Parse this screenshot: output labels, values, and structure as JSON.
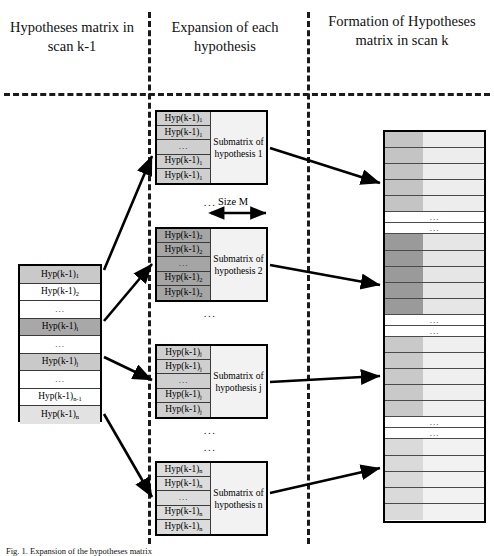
{
  "figure": {
    "caption": "Fig. 1. Expansion of the hypotheses matrix"
  },
  "columns": {
    "left_title": "Hypotheses matrix in scan k-1",
    "middle_title": "Expansion of each hypothesis",
    "right_title": "Formation of Hypotheses matrix in scan k"
  },
  "left_matrix": {
    "name": "hypotheses-matrix-scan-k-1",
    "rows": [
      {
        "label": "Hyp(k-1)",
        "sub": "1",
        "shade": "#c9c9c9"
      },
      {
        "label": "Hyp(k-1)",
        "sub": "2",
        "shade": "#ffffff"
      },
      {
        "label": "...",
        "sub": "",
        "shade": "#ffffff"
      },
      {
        "label": "Hyp(k-1)",
        "sub": "i",
        "shade": "#a8a8a8"
      },
      {
        "label": "...",
        "sub": "",
        "shade": "#ffffff"
      },
      {
        "label": "Hyp(k-1)",
        "sub": "j",
        "shade": "#c9c9c9"
      },
      {
        "label": "...",
        "sub": "",
        "shade": "#ffffff"
      },
      {
        "label": "Hyp(k-1)",
        "sub": "n-1",
        "shade": "#ffffff"
      },
      {
        "label": "Hyp(k-1)",
        "sub": "n",
        "shade": "#e2e2e2"
      }
    ]
  },
  "size_label": "Size M",
  "ellipsis": "...",
  "submatrices": [
    {
      "name": "submatrix-hypothesis-1",
      "title": "Submatrix of hypothesis 1",
      "cell_shade": "#cfcfcf",
      "rows": [
        {
          "label": "Hyp(k-1)",
          "sub": "1"
        },
        {
          "label": "Hyp(k-1)",
          "sub": "1"
        },
        {
          "label": "...",
          "sub": ""
        },
        {
          "label": "Hyp(k-1)",
          "sub": "1"
        },
        {
          "label": "Hyp(k-1)",
          "sub": "1"
        }
      ]
    },
    {
      "name": "submatrix-hypothesis-2",
      "title": "Submatrix of hypothesis 2",
      "cell_shade": "#a5a5a5",
      "rows": [
        {
          "label": "Hyp(k-1)",
          "sub": "2"
        },
        {
          "label": "Hyp(k-1)",
          "sub": "2"
        },
        {
          "label": "...",
          "sub": ""
        },
        {
          "label": "Hyp(k-1)",
          "sub": "2"
        },
        {
          "label": "Hyp(k-1)",
          "sub": "2"
        }
      ]
    },
    {
      "name": "submatrix-hypothesis-j",
      "title": "Submatrix of hypothesis j",
      "cell_shade": "#cfcfcf",
      "rows": [
        {
          "label": "Hyp(k-1)",
          "sub": "j"
        },
        {
          "label": "Hyp(k-1)",
          "sub": "j"
        },
        {
          "label": "...",
          "sub": ""
        },
        {
          "label": "Hyp(k-1)",
          "sub": "j"
        },
        {
          "label": "Hyp(k-1)",
          "sub": "j"
        }
      ]
    },
    {
      "name": "submatrix-hypothesis-n",
      "title": "Submatrix of hypothesis n",
      "cell_shade": "#dcdcdc",
      "rows": [
        {
          "label": "Hyp(k-1)",
          "sub": "n"
        },
        {
          "label": "Hyp(k-1)",
          "sub": "n"
        },
        {
          "label": "...",
          "sub": ""
        },
        {
          "label": "Hyp(k-1)",
          "sub": "n"
        },
        {
          "label": "Hyp(k-1)",
          "sub": "n"
        }
      ]
    }
  ],
  "right_matrix": {
    "name": "hypotheses-matrix-scan-k",
    "groups": [
      {
        "left_shade": "#c4c4c4",
        "right_shade": "#ededed",
        "count": 5
      },
      {
        "left_shade": "#9a9a9a",
        "right_shade": "#e6e6e6",
        "count": 5
      },
      {
        "left_shade": "#c9c9c9",
        "right_shade": "#efefef",
        "count": 5
      },
      {
        "left_shade": "#dadada",
        "right_shade": "#f2f2f2",
        "count": 5
      }
    ]
  },
  "colors": {
    "ink": "#000000",
    "rule": "#3a3a3a",
    "dash": "#1a1a1a",
    "page": "#ffffff"
  }
}
